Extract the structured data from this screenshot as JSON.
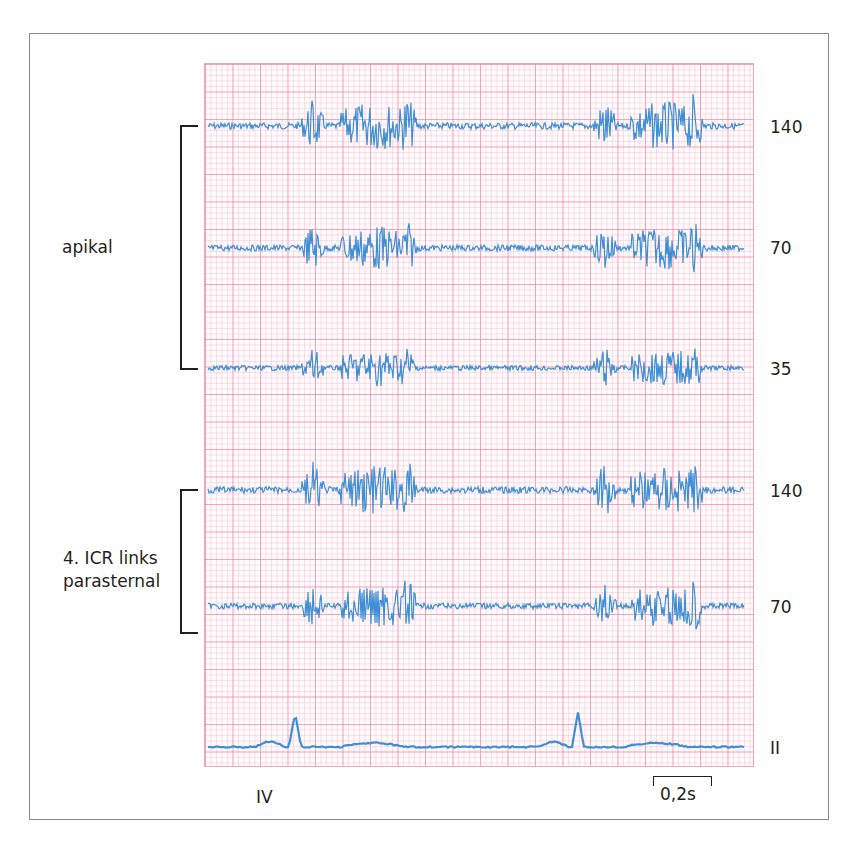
{
  "figure": {
    "colors": {
      "grid_major": "#ec7896",
      "grid_minor": "#f0aabe",
      "trace": "#3f8fd6",
      "text": "#231f20",
      "frame": "#8c8c8c"
    },
    "right_labels": [
      "140",
      "70",
      "35",
      "140",
      "70",
      "II"
    ],
    "left_labels": {
      "apical": "apikal",
      "parasternal_line1": "4. ICR links",
      "parasternal_line2": "parasternal"
    },
    "bottom_label": "IV",
    "scale_bar": "0,2s"
  },
  "chart_data": {
    "type": "line",
    "title": "",
    "series": [
      {
        "name": "apikal 140",
        "group": "apikal",
        "filter": "140",
        "baseline_y_px": 126
      },
      {
        "name": "apikal 70",
        "group": "apikal",
        "filter": "70",
        "baseline_y_px": 248
      },
      {
        "name": "apikal 35",
        "group": "apikal",
        "filter": "35",
        "baseline_y_px": 368
      },
      {
        "name": "4. ICR links parasternal 140",
        "group": "4. ICR links parasternal",
        "filter": "140",
        "baseline_y_px": 490
      },
      {
        "name": "4. ICR links parasternal 70",
        "group": "4. ICR links parasternal",
        "filter": "70",
        "baseline_y_px": 606
      },
      {
        "name": "II",
        "group": "ECG",
        "filter": "II",
        "baseline_y_px": 747
      }
    ],
    "events": {
      "first_heart_sound_x_px": [
        313,
        605
      ],
      "second_heart_sound_x_px": [
        407,
        693
      ],
      "systolic_murmur_x_range_px": [
        [
          340,
          410
        ],
        [
          630,
          700
        ]
      ],
      "ecg_r_wave_x_px": [
        295,
        578
      ]
    },
    "xlabel": "IV",
    "time_scale": "0,2s",
    "grid": true
  }
}
